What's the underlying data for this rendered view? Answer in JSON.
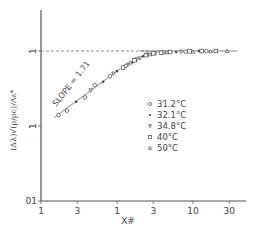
{
  "chart_data": {
    "type": "scatter",
    "title": "",
    "xlabel": "X#",
    "ylabel": "(Δλ)√(ρ/ρc)/Λε*",
    "xscale": "log",
    "yscale": "log",
    "xlim": [
      0.1,
      40
    ],
    "ylim": [
      0.01,
      3
    ],
    "x_ticks": [
      0.1,
      0.3,
      1,
      3,
      10,
      30
    ],
    "x_tick_labels": [
      "1",
      "3",
      "1",
      "3",
      "10",
      "30"
    ],
    "y_ticks": [
      0.01,
      0.1,
      1
    ],
    "y_tick_labels": [
      "01",
      "1",
      "1"
    ],
    "grid": false,
    "reference_line": {
      "y": 1,
      "style": "dashed",
      "label": ""
    },
    "annotation": {
      "text": "SLOPE = 1.71",
      "x": 0.15,
      "y": 0.15
    },
    "legend": {
      "position": "right-center",
      "entries": [
        {
          "marker": "○",
          "label": "31.2°C"
        },
        {
          "marker": "•",
          "label": "32.1°C"
        },
        {
          "marker": "▽",
          "label": "34.8°C"
        },
        {
          "marker": "□",
          "label": "40°C"
        },
        {
          "marker": "△",
          "label": "50°C"
        }
      ]
    },
    "series": [
      {
        "name": "31.2°C",
        "marker": "circle",
        "x": [
          0.17,
          0.22,
          0.38,
          0.51,
          0.81,
          1.3,
          1.8,
          2.5,
          4.0,
          8.0,
          15.0
        ],
        "y": [
          0.14,
          0.16,
          0.24,
          0.35,
          0.46,
          0.63,
          0.78,
          0.9,
          0.96,
          0.98,
          1.0
        ]
      },
      {
        "name": "32.1°C",
        "marker": "dot",
        "x": [
          0.29,
          0.66,
          1.0,
          1.6,
          2.2,
          6.0,
          12.0
        ],
        "y": [
          0.21,
          0.39,
          0.54,
          0.71,
          0.85,
          0.97,
          1.0
        ]
      },
      {
        "name": "34.8°C",
        "marker": "triangle-down",
        "x": [
          0.45,
          0.9,
          1.4,
          2.0,
          3.2,
          7.0
        ],
        "y": [
          0.3,
          0.5,
          0.66,
          0.8,
          0.93,
          0.98
        ]
      },
      {
        "name": "40°C",
        "marker": "square",
        "x": [
          1.2,
          1.7,
          2.4,
          3.0,
          3.8,
          5.0,
          9.0,
          13.0,
          20.0
        ],
        "y": [
          0.6,
          0.75,
          0.88,
          0.93,
          0.95,
          0.97,
          0.99,
          1.0,
          1.0
        ]
      },
      {
        "name": "50°C",
        "marker": "triangle-up",
        "x": [
          1.5,
          2.7,
          4.5,
          10.0,
          17.0,
          28.0
        ],
        "y": [
          0.7,
          0.9,
          0.96,
          0.98,
          0.99,
          1.0
        ]
      }
    ],
    "fit_lines": [
      {
        "name": "slope-1.71",
        "x": [
          0.15,
          1.1
        ],
        "y": [
          0.13,
          0.58
        ]
      },
      {
        "name": "plateau",
        "x": [
          2.0,
          38.0
        ],
        "y": [
          1.0,
          1.0
        ]
      }
    ]
  }
}
